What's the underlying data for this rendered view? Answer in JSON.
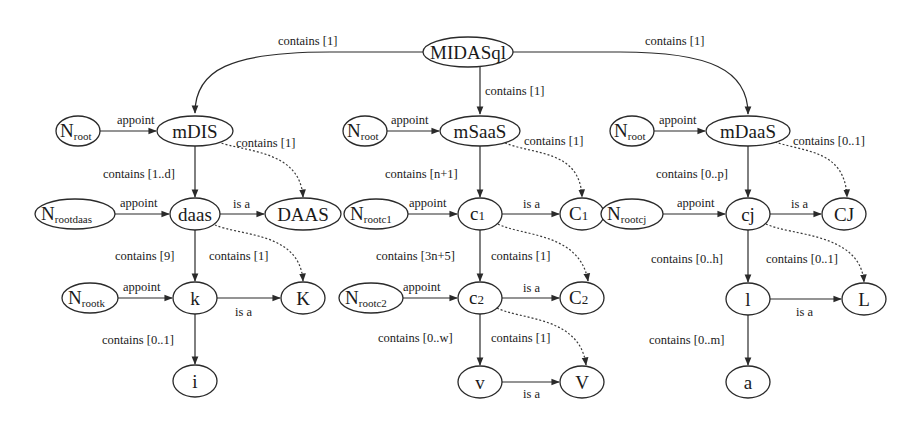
{
  "diagram": {
    "type": "hierarchy-graph",
    "nodes": [
      {
        "id": "MIDASql",
        "label": "MIDASql",
        "cx": 468,
        "cy": 52,
        "rx": 45,
        "ry": 15
      },
      {
        "id": "mDIS",
        "label": "mDIS",
        "cx": 195,
        "cy": 131,
        "rx": 38,
        "ry": 15
      },
      {
        "id": "mSaaS",
        "label": "mSaaS",
        "cx": 480,
        "cy": 131,
        "rx": 40,
        "ry": 15
      },
      {
        "id": "mDaaS",
        "label": "mDaaS",
        "cx": 748,
        "cy": 131,
        "rx": 42,
        "ry": 15
      },
      {
        "id": "Nroot1",
        "label": "N",
        "sub": "root",
        "cx": 78,
        "cy": 131,
        "rx": 22,
        "ry": 15
      },
      {
        "id": "Nroot2",
        "label": "N",
        "sub": "root",
        "cx": 365,
        "cy": 131,
        "rx": 22,
        "ry": 15
      },
      {
        "id": "Nroot3",
        "label": "N",
        "sub": "root",
        "cx": 632,
        "cy": 131,
        "rx": 22,
        "ry": 15
      },
      {
        "id": "daas",
        "label": "daas",
        "cx": 195,
        "cy": 214,
        "rx": 25,
        "ry": 16
      },
      {
        "id": "DAAS",
        "label": "DAAS",
        "cx": 303,
        "cy": 214,
        "rx": 38,
        "ry": 16
      },
      {
        "id": "Nrootdaas",
        "label": "N",
        "sub": "rootdaas",
        "cx": 75,
        "cy": 214,
        "rx": 40,
        "ry": 15
      },
      {
        "id": "c1",
        "label": "c1",
        "cx": 480,
        "cy": 214,
        "rx": 22,
        "ry": 16
      },
      {
        "id": "C1",
        "label": "C1",
        "cx": 582,
        "cy": 214,
        "rx": 22,
        "ry": 16
      },
      {
        "id": "Nrootc1",
        "label": "N",
        "sub": "rootc1",
        "cx": 376,
        "cy": 214,
        "rx": 32,
        "ry": 15
      },
      {
        "id": "cj",
        "label": "cj",
        "cx": 748,
        "cy": 214,
        "rx": 22,
        "ry": 16
      },
      {
        "id": "CJ",
        "label": "CJ",
        "cx": 844,
        "cy": 214,
        "rx": 22,
        "ry": 16
      },
      {
        "id": "Nrootcj",
        "label": "N",
        "sub": "rootcj",
        "cx": 632,
        "cy": 214,
        "rx": 31,
        "ry": 15
      },
      {
        "id": "k",
        "label": "k",
        "cx": 195,
        "cy": 298,
        "rx": 22,
        "ry": 16
      },
      {
        "id": "K",
        "label": "K",
        "cx": 303,
        "cy": 298,
        "rx": 22,
        "ry": 16
      },
      {
        "id": "Nrootk",
        "label": "N",
        "sub": "rootk",
        "cx": 90,
        "cy": 298,
        "rx": 28,
        "ry": 15
      },
      {
        "id": "c2",
        "label": "c2",
        "cx": 480,
        "cy": 298,
        "rx": 22,
        "ry": 16
      },
      {
        "id": "C2",
        "label": "C2",
        "cx": 582,
        "cy": 298,
        "rx": 22,
        "ry": 16
      },
      {
        "id": "Nrootc2",
        "label": "N",
        "sub": "rootc2",
        "cx": 371,
        "cy": 298,
        "rx": 32,
        "ry": 15
      },
      {
        "id": "l",
        "label": "l",
        "cx": 748,
        "cy": 299,
        "rx": 22,
        "ry": 16
      },
      {
        "id": "L",
        "label": "L",
        "cx": 864,
        "cy": 299,
        "rx": 22,
        "ry": 16
      },
      {
        "id": "i",
        "label": "i",
        "cx": 195,
        "cy": 381,
        "rx": 22,
        "ry": 16
      },
      {
        "id": "v",
        "label": "v",
        "cx": 480,
        "cy": 382,
        "rx": 22,
        "ry": 16
      },
      {
        "id": "V",
        "label": "V",
        "cx": 582,
        "cy": 382,
        "rx": 22,
        "ry": 16
      },
      {
        "id": "a",
        "label": "a",
        "cx": 748,
        "cy": 382,
        "rx": 22,
        "ry": 16
      }
    ],
    "edges": [
      {
        "from": "MIDASql",
        "to": "mDIS",
        "label": "contains [1]",
        "style": "solid"
      },
      {
        "from": "MIDASql",
        "to": "mSaaS",
        "label": "contains [1]",
        "style": "solid"
      },
      {
        "from": "MIDASql",
        "to": "mDaaS",
        "label": "contains [1]",
        "style": "solid"
      },
      {
        "from": "Nroot1",
        "to": "mDIS",
        "label": "appoint",
        "style": "solid"
      },
      {
        "from": "Nroot2",
        "to": "mSaaS",
        "label": "appoint",
        "style": "solid"
      },
      {
        "from": "Nroot3",
        "to": "mDaaS",
        "label": "appoint",
        "style": "solid"
      },
      {
        "from": "mDIS",
        "to": "daas",
        "label": "contains [1..d]",
        "style": "solid"
      },
      {
        "from": "mDIS",
        "to": "DAAS",
        "label": "contains [1]",
        "style": "dotted"
      },
      {
        "from": "mSaaS",
        "to": "c1",
        "label": "contains [n+1]",
        "style": "solid"
      },
      {
        "from": "mSaaS",
        "to": "C1",
        "label": "contains [1]",
        "style": "dotted"
      },
      {
        "from": "mDaaS",
        "to": "cj",
        "label": "contains [0..p]",
        "style": "solid"
      },
      {
        "from": "mDaaS",
        "to": "CJ",
        "label": "contains [0..1]",
        "style": "dotted"
      },
      {
        "from": "Nrootdaas",
        "to": "daas",
        "label": "appoint",
        "style": "solid"
      },
      {
        "from": "daas",
        "to": "DAAS",
        "label": "is a",
        "style": "solid"
      },
      {
        "from": "Nrootc1",
        "to": "c1",
        "label": "appoint",
        "style": "solid"
      },
      {
        "from": "c1",
        "to": "C1",
        "label": "is a",
        "style": "solid"
      },
      {
        "from": "Nrootcj",
        "to": "cj",
        "label": "appoint",
        "style": "solid"
      },
      {
        "from": "cj",
        "to": "CJ",
        "label": "is a",
        "style": "solid"
      },
      {
        "from": "daas",
        "to": "k",
        "label": "contains [9]",
        "style": "solid"
      },
      {
        "from": "daas",
        "to": "K",
        "label": "contains [1]",
        "style": "dotted"
      },
      {
        "from": "c1",
        "to": "c2",
        "label": "contains [3n+5]",
        "style": "solid"
      },
      {
        "from": "c1",
        "to": "C2",
        "label": "contains [1]",
        "style": "dotted"
      },
      {
        "from": "cj",
        "to": "l",
        "label": "contains [0..h]",
        "style": "solid"
      },
      {
        "from": "cj",
        "to": "L",
        "label": "contains [0..1]",
        "style": "dotted"
      },
      {
        "from": "Nrootk",
        "to": "k",
        "label": "appoint",
        "style": "solid"
      },
      {
        "from": "k",
        "to": "K",
        "label": "is a",
        "style": "solid"
      },
      {
        "from": "Nrootc2",
        "to": "c2",
        "label": "appoint",
        "style": "solid"
      },
      {
        "from": "c2",
        "to": "C2",
        "label": "is a",
        "style": "solid"
      },
      {
        "from": "l",
        "to": "L",
        "label": "is a",
        "style": "solid"
      },
      {
        "from": "k",
        "to": "i",
        "label": "contains [0..1]",
        "style": "solid"
      },
      {
        "from": "c2",
        "to": "v",
        "label": "contains [0..w]",
        "style": "solid"
      },
      {
        "from": "c2",
        "to": "V",
        "label": "contains [1]",
        "style": "dotted"
      },
      {
        "from": "v",
        "to": "V",
        "label": "is a",
        "style": "solid"
      },
      {
        "from": "l",
        "to": "a",
        "label": "contains [0..m]",
        "style": "solid"
      }
    ]
  },
  "labels": {
    "n": "N",
    "sub_root": "root",
    "sub_rootdaas": "rootdaas",
    "sub_rootc1": "rootc1",
    "sub_rootcj": "rootcj",
    "sub_rootk": "rootk",
    "sub_rootc2": "rootc2",
    "MIDASql": "MIDASql",
    "mDIS": "mDIS",
    "mSaaS": "mSaaS",
    "mDaaS": "mDaaS",
    "daas": "daas",
    "DAAS": "DAAS",
    "c1_main": "c",
    "c1_sub": "1",
    "C1_main": "C",
    "C1_sub": "1",
    "cj": "cj",
    "CJ": "CJ",
    "k": "k",
    "K": "K",
    "c2_main": "c",
    "c2_sub": "2",
    "C2_main": "C",
    "C2_sub": "2",
    "l": "l",
    "L": "L",
    "i": "i",
    "v": "v",
    "V": "V",
    "a": "a",
    "appoint": "appoint",
    "is_a": "is a",
    "contains_1": "contains [1]",
    "contains_1_d": "contains [1..d]",
    "contains_n1": "contains [n+1]",
    "contains_0_p": "contains [0..p]",
    "contains_0_1": "contains [0..1]",
    "contains_9": "contains [9]",
    "contains_3n5": "contains [3n+5]",
    "contains_0_h": "contains [0..h]",
    "contains_0_w": "contains [0..w]",
    "contains_0_m": "contains [0..m]"
  }
}
